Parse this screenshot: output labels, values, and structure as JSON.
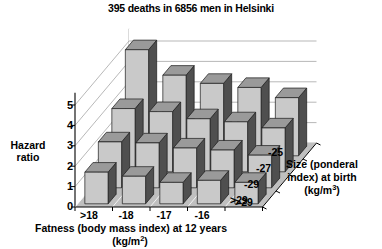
{
  "chart_data": {
    "type": "bar",
    "title": "395 deaths in 6856 men in Helsinki",
    "subtitle": "",
    "xlabel": "Fatness (body mass index) at 12 years",
    "xlabel_units": "(kg/m²)",
    "ylabel": "Hazard\nratio",
    "ylabel_line1": "Hazard",
    "ylabel_line2": "ratio",
    "zlabel_line1": "Size (ponderal",
    "zlabel_line2": "index) at birth",
    "zlabel_units": "(kg/m³)",
    "categories": [
      ">18",
      "-18",
      "-17",
      "-16",
      ">29"
    ],
    "depth_categories": [
      "-25",
      "-27",
      "-29",
      ">29"
    ],
    "yticks": [
      "0",
      "1",
      "2",
      "3",
      "4",
      "5"
    ],
    "ylim": [
      0,
      5.6
    ],
    "grid": true,
    "legend": "none",
    "series": [
      {
        "name": ">29",
        "depth_index": 0,
        "values": [
          1.55,
          1.35,
          1.05,
          1.15,
          1.05
        ]
      },
      {
        "name": "-29",
        "depth_index": 1,
        "values": [
          2.25,
          2.2,
          1.95,
          1.85,
          1.6
        ]
      },
      {
        "name": "-27",
        "depth_index": 2,
        "values": [
          3.1,
          2.95,
          2.6,
          2.45,
          2.15
        ]
      },
      {
        "name": "-25",
        "depth_index": 3,
        "values": [
          5.2,
          3.95,
          3.55,
          3.35,
          2.85
        ]
      }
    ],
    "colors": {
      "bar_front": "#c9c9c9",
      "bar_side": "#4f4f4f",
      "bar_top": "#9a9a9a",
      "floor": "#bfbfbf",
      "grid": "#9a9a9a",
      "axis": "#000000",
      "background": "#ffffff"
    }
  }
}
